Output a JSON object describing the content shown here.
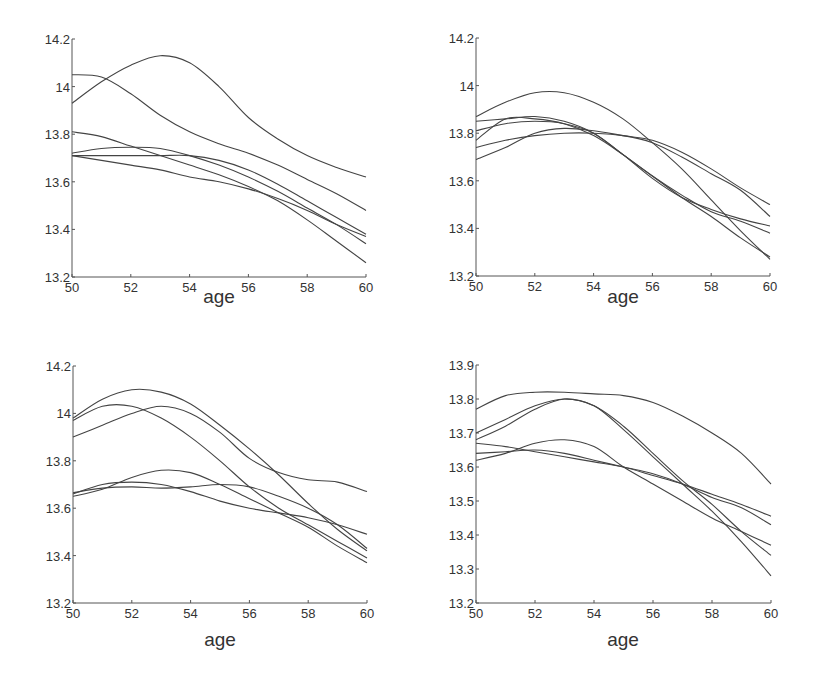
{
  "chart_data": [
    {
      "type": "line",
      "panel": "top-left",
      "title": "",
      "xlabel": "age",
      "ylabel": "",
      "xlim": [
        50,
        60
      ],
      "ylim": [
        13.2,
        14.2
      ],
      "xticks": [
        50,
        52,
        54,
        56,
        58,
        60
      ],
      "yticks": [
        13.2,
        13.4,
        13.6,
        13.8,
        14,
        14.2
      ],
      "ytick_labels": [
        "13.2",
        "13.4",
        "13.6",
        "13.8",
        "14",
        "14.2"
      ],
      "grid": false,
      "x": [
        50,
        51,
        52,
        53,
        54,
        55,
        56,
        57,
        58,
        59,
        60
      ],
      "series": [
        {
          "name": "curve-1",
          "values": [
            13.93,
            14.02,
            14.09,
            14.13,
            14.1,
            14.0,
            13.87,
            13.78,
            13.71,
            13.66,
            13.62
          ]
        },
        {
          "name": "curve-2",
          "values": [
            14.05,
            14.04,
            13.97,
            13.88,
            13.81,
            13.76,
            13.72,
            13.67,
            13.61,
            13.55,
            13.48
          ]
        },
        {
          "name": "curve-3",
          "values": [
            13.81,
            13.79,
            13.75,
            13.71,
            13.67,
            13.63,
            13.58,
            13.52,
            13.44,
            13.35,
            13.26
          ]
        },
        {
          "name": "curve-4",
          "values": [
            13.72,
            13.74,
            13.745,
            13.74,
            13.71,
            13.67,
            13.62,
            13.56,
            13.49,
            13.42,
            13.34
          ]
        },
        {
          "name": "curve-5",
          "values": [
            13.71,
            13.71,
            13.71,
            13.71,
            13.71,
            13.69,
            13.65,
            13.59,
            13.52,
            13.45,
            13.38
          ]
        },
        {
          "name": "curve-6",
          "values": [
            13.71,
            13.69,
            13.67,
            13.65,
            13.62,
            13.6,
            13.57,
            13.53,
            13.48,
            13.42,
            13.37
          ]
        }
      ]
    },
    {
      "type": "line",
      "panel": "top-right",
      "title": "",
      "xlabel": "age",
      "ylabel": "",
      "xlim": [
        50,
        60
      ],
      "ylim": [
        13.2,
        14.2
      ],
      "xticks": [
        50,
        52,
        54,
        56,
        58,
        60
      ],
      "yticks": [
        13.2,
        13.4,
        13.6,
        13.8,
        14,
        14.2
      ],
      "ytick_labels": [
        "13.2",
        "13.4",
        "13.6",
        "13.8",
        "14",
        "14.2"
      ],
      "grid": false,
      "x": [
        50,
        51,
        52,
        53,
        54,
        55,
        56,
        57,
        58,
        59,
        60
      ],
      "series": [
        {
          "name": "curve-1",
          "values": [
            13.87,
            13.93,
            13.97,
            13.97,
            13.93,
            13.86,
            13.76,
            13.65,
            13.52,
            13.39,
            13.27
          ]
        },
        {
          "name": "curve-2",
          "values": [
            13.85,
            13.86,
            13.87,
            13.85,
            13.8,
            13.71,
            13.61,
            13.53,
            13.48,
            13.44,
            13.41
          ]
        },
        {
          "name": "curve-3",
          "values": [
            13.81,
            13.84,
            13.85,
            13.84,
            13.8,
            13.71,
            13.62,
            13.53,
            13.45,
            13.36,
            13.28
          ]
        },
        {
          "name": "curve-4",
          "values": [
            13.77,
            13.86,
            13.86,
            13.84,
            13.79,
            13.71,
            13.62,
            13.54,
            13.47,
            13.43,
            13.38
          ]
        },
        {
          "name": "curve-5",
          "values": [
            13.74,
            13.77,
            13.79,
            13.8,
            13.8,
            13.79,
            13.76,
            13.7,
            13.63,
            13.56,
            13.45
          ]
        },
        {
          "name": "curve-6",
          "values": [
            13.69,
            13.74,
            13.8,
            13.82,
            13.81,
            13.79,
            13.77,
            13.72,
            13.65,
            13.57,
            13.5
          ]
        }
      ]
    },
    {
      "type": "line",
      "panel": "bottom-left",
      "title": "",
      "xlabel": "age",
      "ylabel": "",
      "xlim": [
        50,
        60
      ],
      "ylim": [
        13.2,
        14.2
      ],
      "xticks": [
        50,
        52,
        54,
        56,
        58,
        60
      ],
      "yticks": [
        13.2,
        13.4,
        13.6,
        13.8,
        14,
        14.2
      ],
      "ytick_labels": [
        "13.2",
        "13.4",
        "13.6",
        "13.8",
        "14",
        "14.2"
      ],
      "grid": false,
      "x": [
        50,
        51,
        52,
        53,
        54,
        55,
        56,
        57,
        58,
        59,
        60
      ],
      "series": [
        {
          "name": "curve-1",
          "values": [
            13.98,
            14.06,
            14.1,
            14.09,
            14.04,
            13.95,
            13.85,
            13.74,
            13.62,
            13.51,
            13.42
          ]
        },
        {
          "name": "curve-2",
          "values": [
            13.97,
            14.03,
            14.03,
            13.98,
            13.9,
            13.8,
            13.69,
            13.6,
            13.53,
            13.46,
            13.39
          ]
        },
        {
          "name": "curve-3",
          "values": [
            13.9,
            13.95,
            14.0,
            14.03,
            14.0,
            13.92,
            13.81,
            13.75,
            13.72,
            13.71,
            13.67
          ]
        },
        {
          "name": "curve-4",
          "values": [
            13.65,
            13.68,
            13.73,
            13.76,
            13.75,
            13.7,
            13.64,
            13.58,
            13.52,
            13.44,
            13.37
          ]
        },
        {
          "name": "curve-5",
          "values": [
            13.66,
            13.7,
            13.71,
            13.7,
            13.67,
            13.63,
            13.6,
            13.58,
            13.56,
            13.53,
            13.49
          ]
        },
        {
          "name": "curve-6",
          "values": [
            13.665,
            13.685,
            13.69,
            13.685,
            13.69,
            13.7,
            13.69,
            13.65,
            13.6,
            13.53,
            13.43
          ]
        }
      ]
    },
    {
      "type": "line",
      "panel": "bottom-right",
      "title": "",
      "xlabel": "age",
      "ylabel": "",
      "xlim": [
        50,
        60
      ],
      "ylim": [
        13.2,
        13.9
      ],
      "xticks": [
        50,
        52,
        54,
        56,
        58,
        60
      ],
      "yticks": [
        13.2,
        13.3,
        13.4,
        13.5,
        13.6,
        13.7,
        13.8,
        13.9
      ],
      "ytick_labels": [
        "13.2",
        "13.3",
        "13.4",
        "13.5",
        "13.6",
        "13.7",
        "13.8",
        "13.9"
      ],
      "grid": false,
      "x": [
        50,
        51,
        52,
        53,
        54,
        55,
        56,
        57,
        58,
        59,
        60
      ],
      "series": [
        {
          "name": "curve-1",
          "values": [
            13.77,
            13.81,
            13.82,
            13.82,
            13.815,
            13.81,
            13.79,
            13.75,
            13.7,
            13.64,
            13.55
          ]
        },
        {
          "name": "curve-2",
          "values": [
            13.7,
            13.74,
            13.78,
            13.8,
            13.78,
            13.71,
            13.63,
            13.55,
            13.47,
            13.38,
            13.28
          ]
        },
        {
          "name": "curve-3",
          "values": [
            13.68,
            13.72,
            13.77,
            13.8,
            13.78,
            13.72,
            13.64,
            13.56,
            13.49,
            13.41,
            13.34
          ]
        },
        {
          "name": "curve-4",
          "values": [
            13.62,
            13.64,
            13.67,
            13.68,
            13.66,
            13.6,
            13.55,
            13.5,
            13.45,
            13.41,
            13.37
          ]
        },
        {
          "name": "curve-5",
          "values": [
            13.64,
            13.645,
            13.65,
            13.64,
            13.62,
            13.6,
            13.58,
            13.55,
            13.51,
            13.48,
            13.43
          ]
        },
        {
          "name": "curve-6",
          "values": [
            13.67,
            13.66,
            13.645,
            13.63,
            13.615,
            13.6,
            13.575,
            13.55,
            13.52,
            13.49,
            13.455
          ]
        }
      ]
    }
  ],
  "panels": [
    {
      "xlabel": "age",
      "xtick_labels": [
        "50",
        "52",
        "54",
        "56",
        "58",
        "60"
      ]
    },
    {
      "xlabel": "age",
      "xtick_labels": [
        "50",
        "52",
        "54",
        "56",
        "58",
        "60"
      ]
    },
    {
      "xlabel": "age",
      "xtick_labels": [
        "50",
        "52",
        "54",
        "56",
        "58",
        "60"
      ]
    },
    {
      "xlabel": "age",
      "xtick_labels": [
        "50",
        "52",
        "54",
        "56",
        "58",
        "60"
      ]
    }
  ],
  "style": {
    "line_color": "#444444",
    "axis_color": "#555555",
    "text_color": "#333333",
    "background": "#ffffff"
  }
}
